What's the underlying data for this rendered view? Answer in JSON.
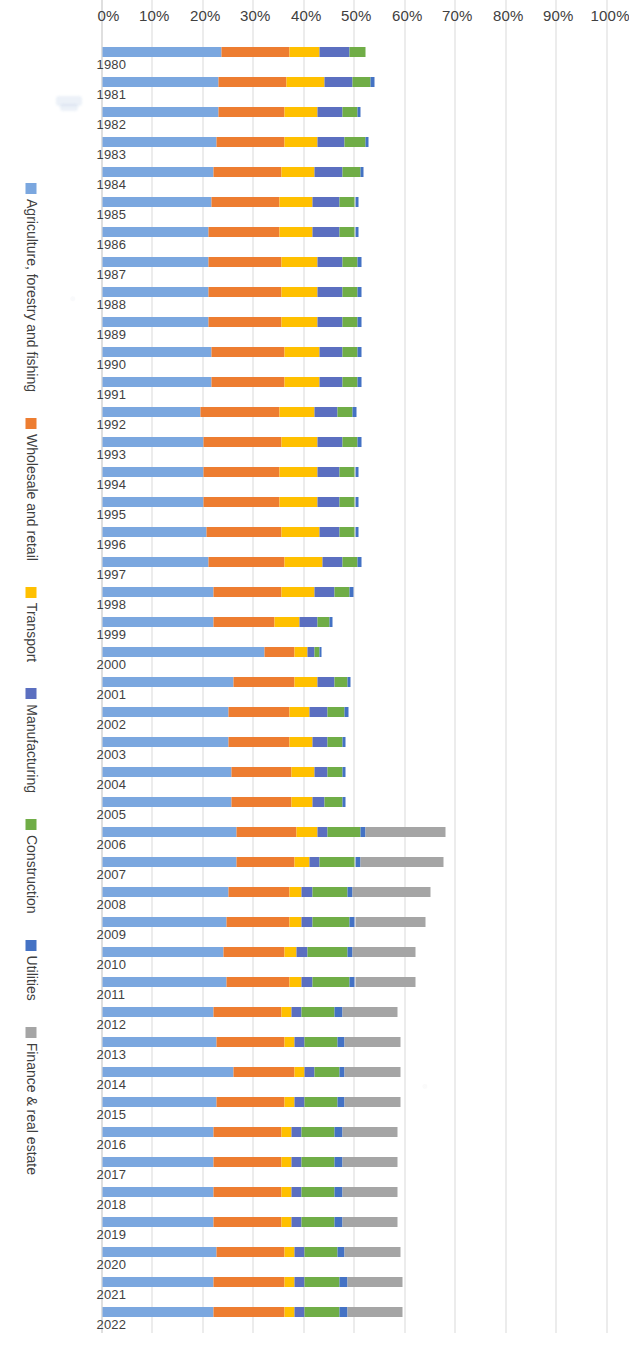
{
  "chart_data": {
    "type": "bar",
    "subtype": "stacked-horizontal-100",
    "title": "",
    "xlabel": "",
    "ylabel": "",
    "orientation": "horizontal",
    "stacked": true,
    "grid": true,
    "legend_position": "right",
    "value_axis": {
      "min": 0,
      "max": 100,
      "unit": "%",
      "ticks": [
        0,
        10,
        20,
        30,
        40,
        50,
        60,
        70,
        80,
        90,
        100
      ],
      "tick_labels": [
        "0%",
        "10%",
        "20%",
        "30%",
        "40%",
        "50%",
        "60%",
        "70%",
        "80%",
        "90%",
        "100%"
      ]
    },
    "categories": [
      "1980",
      "1981",
      "1982",
      "1983",
      "1984",
      "1985",
      "1986",
      "1987",
      "1988",
      "1989",
      "1990",
      "1991",
      "1992",
      "1993",
      "1994",
      "1995",
      "1996",
      "1997",
      "1998",
      "1999",
      "2000",
      "2001",
      "2002",
      "2003",
      "2004",
      "2005",
      "2006",
      "2007",
      "2008",
      "2009",
      "2010",
      "2011",
      "2012",
      "2013",
      "2014",
      "2015",
      "2016",
      "2017",
      "2018",
      "2019",
      "2020",
      "2021",
      "2022"
    ],
    "series": [
      {
        "name": "Agriculture, forestry and fishing",
        "color": "#7BA7DF",
        "values": [
          23.5,
          23.0,
          23.0,
          22.5,
          22.0,
          21.5,
          21.0,
          21.0,
          21.0,
          21.0,
          21.5,
          21.5,
          19.5,
          20.0,
          20.0,
          20.0,
          20.5,
          21.0,
          22.0,
          22.0,
          32.0,
          26.0,
          25.0,
          25.0,
          25.5,
          25.5,
          26.5,
          26.5,
          25.0,
          24.5,
          24.0,
          24.5,
          22.0,
          22.5,
          26.0,
          22.5,
          22.0,
          22.0,
          22.0,
          22.0,
          22.5,
          22.0,
          22.0
        ]
      },
      {
        "name": "Wholesale and retail",
        "color": "#ED7D31",
        "values": [
          13.5,
          13.5,
          13.0,
          13.5,
          13.5,
          13.5,
          14.0,
          14.5,
          14.5,
          14.5,
          14.5,
          14.5,
          15.5,
          15.5,
          15.0,
          15.0,
          15.0,
          15.0,
          13.5,
          12.0,
          6.0,
          12.0,
          12.0,
          12.0,
          12.0,
          12.0,
          12.0,
          11.5,
          12.0,
          12.5,
          12.0,
          12.5,
          13.5,
          13.5,
          12.0,
          13.5,
          13.5,
          13.5,
          13.5,
          13.5,
          13.5,
          14.0,
          14.0
        ]
      },
      {
        "name": "Transport",
        "color": "#FFC000",
        "values": [
          6.0,
          7.5,
          6.5,
          6.5,
          6.5,
          6.5,
          6.5,
          7.0,
          7.0,
          7.0,
          7.0,
          7.0,
          7.0,
          7.0,
          7.5,
          7.5,
          7.5,
          7.5,
          6.5,
          5.0,
          2.5,
          4.5,
          4.0,
          4.5,
          4.5,
          4.0,
          4.0,
          3.0,
          2.5,
          2.5,
          2.5,
          2.5,
          2.0,
          2.0,
          2.0,
          2.0,
          2.0,
          2.0,
          2.0,
          2.0,
          2.0,
          2.0,
          2.0
        ]
      },
      {
        "name": "Manufacturing",
        "color": "#5B6FC0",
        "values": [
          6.0,
          5.5,
          5.0,
          5.5,
          5.5,
          5.5,
          5.5,
          5.0,
          5.0,
          5.0,
          4.5,
          4.5,
          4.5,
          5.0,
          4.5,
          4.5,
          4.0,
          4.0,
          4.0,
          3.5,
          1.5,
          3.5,
          3.5,
          3.0,
          2.5,
          2.5,
          2.0,
          2.0,
          2.0,
          2.0,
          2.0,
          2.0,
          2.0,
          2.0,
          2.0,
          2.0,
          2.0,
          2.0,
          2.0,
          2.0,
          2.0,
          2.0,
          2.0
        ]
      },
      {
        "name": "Construction",
        "color": "#70AD47",
        "values": [
          3.0,
          3.5,
          3.0,
          4.0,
          3.5,
          3.0,
          3.0,
          3.0,
          3.0,
          3.0,
          3.0,
          3.0,
          3.0,
          3.0,
          3.0,
          3.0,
          3.0,
          3.0,
          3.0,
          2.5,
          1.0,
          2.5,
          3.5,
          3.0,
          3.0,
          3.5,
          6.5,
          7.0,
          7.0,
          7.5,
          8.0,
          7.5,
          6.5,
          6.5,
          5.0,
          6.5,
          6.5,
          6.5,
          6.5,
          6.5,
          6.5,
          7.0,
          7.0
        ]
      },
      {
        "name": "Utilities",
        "color": "#4472C4",
        "values": [
          0.0,
          0.8,
          0.6,
          0.7,
          0.7,
          0.7,
          0.7,
          0.7,
          0.7,
          0.7,
          0.7,
          0.7,
          0.7,
          0.7,
          0.7,
          0.7,
          0.7,
          0.7,
          0.7,
          0.6,
          0.3,
          0.7,
          0.7,
          0.7,
          0.7,
          0.7,
          1.0,
          1.0,
          1.0,
          1.0,
          1.0,
          1.0,
          1.5,
          1.5,
          1.0,
          1.5,
          1.5,
          1.5,
          1.5,
          1.5,
          1.5,
          1.5,
          1.5
        ]
      },
      {
        "name": "Finance & real estate",
        "color": "#A5A5A5",
        "values": [
          0.0,
          0.0,
          0.0,
          0.0,
          0.0,
          0.0,
          0.0,
          0.0,
          0.0,
          0.0,
          0.0,
          0.0,
          0.0,
          0.0,
          0.0,
          0.0,
          0.0,
          0.0,
          0.0,
          0.0,
          0.0,
          0.0,
          0.0,
          0.0,
          0.0,
          0.0,
          16.0,
          16.5,
          15.5,
          14.0,
          12.5,
          12.0,
          11.0,
          11.0,
          11.0,
          11.0,
          11.0,
          11.0,
          11.0,
          11.0,
          11.0,
          11.0,
          11.0
        ]
      }
    ]
  },
  "legend": {
    "items": [
      {
        "label": "Agriculture, forestry and fishing",
        "color": "#7BA7DF"
      },
      {
        "label": "Wholesale and retail",
        "color": "#ED7D31"
      },
      {
        "label": "Transport",
        "color": "#FFC000"
      },
      {
        "label": "Manufacturing",
        "color": "#5B6FC0"
      },
      {
        "label": "Construction",
        "color": "#70AD47"
      },
      {
        "label": "Utilities",
        "color": "#4472C4"
      },
      {
        "label": "Finance & real estate",
        "color": "#A5A5A5"
      }
    ]
  }
}
